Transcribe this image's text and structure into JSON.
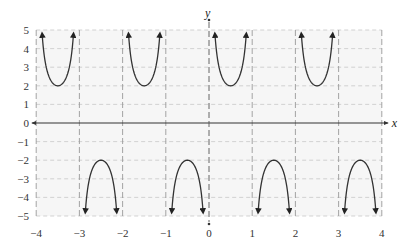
{
  "chart_data": {
    "type": "line",
    "title": "",
    "function": "y = 2 csc(πx)",
    "xlabel": "x",
    "ylabel": "y",
    "xlim": [
      -4,
      4
    ],
    "ylim": [
      -5,
      5
    ],
    "x_ticks": [
      -4,
      -3,
      -2,
      -1,
      0,
      1,
      2,
      3,
      4
    ],
    "y_ticks": [
      5,
      4,
      3,
      2,
      1,
      0,
      -1,
      -2,
      -3,
      -4,
      -5
    ],
    "x_tick_labels": [
      "−4",
      "−3",
      "−2",
      "−1",
      "0",
      "1",
      "2",
      "3",
      "4"
    ],
    "y_tick_labels": [
      "5",
      "4",
      "3",
      "2",
      "1",
      "0",
      "−1",
      "−2",
      "−3",
      "−4",
      "−5"
    ],
    "grid": true,
    "vertical_asymptotes": [
      -4,
      -3,
      -2,
      -1,
      0,
      1,
      2,
      3,
      4
    ],
    "series": [
      {
        "name": "branch",
        "interval": [
          -4,
          -3
        ],
        "direction": "up",
        "vertex": [
          -3.5,
          2
        ]
      },
      {
        "name": "branch",
        "interval": [
          -3,
          -2
        ],
        "direction": "down",
        "vertex": [
          -2.5,
          -2
        ]
      },
      {
        "name": "branch",
        "interval": [
          -2,
          -1
        ],
        "direction": "up",
        "vertex": [
          -1.5,
          2
        ]
      },
      {
        "name": "branch",
        "interval": [
          -1,
          0
        ],
        "direction": "down",
        "vertex": [
          -0.5,
          -2
        ]
      },
      {
        "name": "branch",
        "interval": [
          0,
          1
        ],
        "direction": "up",
        "vertex": [
          0.5,
          2
        ]
      },
      {
        "name": "branch",
        "interval": [
          1,
          2
        ],
        "direction": "down",
        "vertex": [
          1.5,
          -2
        ]
      },
      {
        "name": "branch",
        "interval": [
          2,
          3
        ],
        "direction": "up",
        "vertex": [
          2.5,
          2
        ]
      },
      {
        "name": "branch",
        "interval": [
          3,
          4
        ],
        "direction": "down",
        "vertex": [
          3.5,
          -2
        ]
      }
    ],
    "legend": null
  },
  "layout": {
    "origin_px": [
      209,
      123
    ],
    "unit_x_px": 43.2,
    "unit_y_px": 18.6,
    "curve_color": "#333333",
    "grid_color": "#c8c8c8",
    "asymptote_color": "#9a9a9a",
    "plot_bg": "#f6f6f6"
  }
}
